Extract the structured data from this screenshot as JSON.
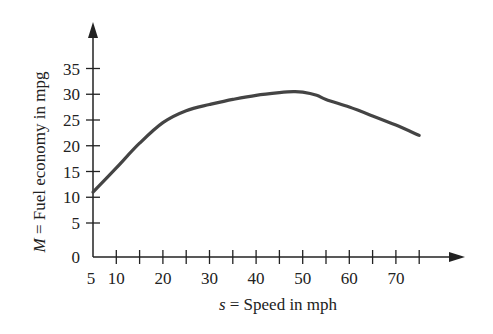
{
  "chart_data": {
    "type": "line",
    "title": "",
    "xlabel": "s = Speed in mph",
    "xlabel_var": "s",
    "xlabel_rest": " = Speed in mph",
    "ylabel": "M = Fuel economy in mpg",
    "ylabel_var": "M",
    "ylabel_rest": " = Fuel economy in mpg",
    "xlim": [
      5,
      80
    ],
    "ylim": [
      0,
      40
    ],
    "grid": false,
    "legend": null,
    "x_tick_labels": [
      "5",
      "10",
      "20",
      "30",
      "40",
      "50",
      "60",
      "70"
    ],
    "x_minor_ticks": [
      10,
      15,
      20,
      25,
      30,
      35,
      40,
      45,
      50,
      55,
      60,
      65,
      70,
      75
    ],
    "y_tick_labels": [
      "0",
      "5",
      "10",
      "15",
      "20",
      "25",
      "30",
      "35"
    ],
    "series": [
      {
        "name": "Fuel economy",
        "color": "#444444",
        "x": [
          5,
          10,
          15,
          20,
          25,
          30,
          35,
          40,
          45,
          48,
          50,
          53,
          55,
          60,
          65,
          70,
          75
        ],
        "y": [
          11,
          15.7,
          20.5,
          24.5,
          26.8,
          28,
          29,
          29.8,
          30.3,
          30.5,
          30.4,
          29.8,
          29,
          27.5,
          25.8,
          24,
          22
        ]
      }
    ]
  },
  "colors": {
    "axis": "#222222",
    "curve": "#444444",
    "background": "#ffffff"
  }
}
